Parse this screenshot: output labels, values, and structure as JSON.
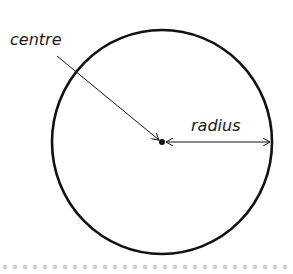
{
  "diagram": {
    "labels": {
      "centre": "centre",
      "radius": "radius"
    },
    "colors": {
      "stroke": "#111111",
      "dots": "#cfcfcf"
    }
  }
}
